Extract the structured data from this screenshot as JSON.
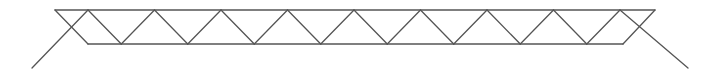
{
  "diagram": {
    "type": "warren-truss",
    "stroke_color": "#555555",
    "background": "#ffffff",
    "top_chord": {
      "x1": 55,
      "x2": 655,
      "y": 10
    },
    "bottom_chord": {
      "x1": 88,
      "x2": 623,
      "y": 44
    },
    "top_nodes_x": [
      88,
      154.5,
      221,
      287.5,
      354,
      420.5,
      487,
      553.5,
      620
    ],
    "bottom_nodes_x": [
      121.25,
      187.75,
      254.25,
      320.75,
      387.25,
      453.75,
      520.25,
      586.75
    ],
    "end_members": [
      {
        "name": "left-end-diagonal",
        "x1": 55,
        "y1": 10,
        "x2": 88,
        "y2": 44
      },
      {
        "name": "right-end-diagonal",
        "x1": 655,
        "y1": 10,
        "x2": 623,
        "y2": 44
      }
    ],
    "supports": [
      {
        "name": "left-support-strut",
        "x1": 32,
        "y1": 68,
        "x2": 88,
        "y2": 10
      },
      {
        "name": "right-support-strut",
        "x1": 620,
        "y1": 10,
        "x2": 688,
        "y2": 68
      }
    ]
  }
}
